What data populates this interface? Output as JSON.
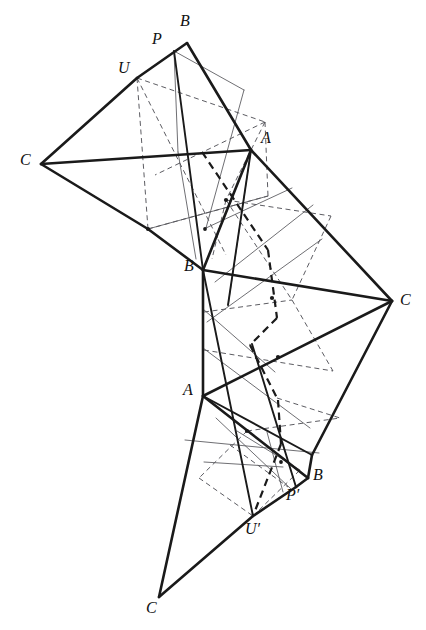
{
  "figure": {
    "kind": "geometric-construction-diagram",
    "background_color": "#ffffff",
    "stroke_colors": {
      "heavy_solid": "#1a1a1a",
      "light_solid": "#55555a",
      "light_dashed": "#4a4a50",
      "heavy_dashed": "#1a1a1a"
    },
    "stroke_widths": {
      "heavy_solid": 2.6,
      "medium_solid": 1.9,
      "light_solid": 0.85,
      "light_dashed": 0.9,
      "heavy_dashed": 2.2
    },
    "canvas": {
      "width": 426,
      "height": 630
    },
    "labels": [
      {
        "name": "label-B-top",
        "text": "B",
        "x": 180,
        "y": 13
      },
      {
        "name": "label-P-top",
        "text": "P",
        "x": 152,
        "y": 31
      },
      {
        "name": "label-U-top",
        "text": "U",
        "x": 118,
        "y": 60
      },
      {
        "name": "label-C-left",
        "text": "C",
        "x": 20,
        "y": 152
      },
      {
        "name": "label-A-upper",
        "text": "A",
        "x": 261,
        "y": 130
      },
      {
        "name": "label-B-middle",
        "text": "B",
        "x": 184,
        "y": 258
      },
      {
        "name": "label-C-right",
        "text": "C",
        "x": 400,
        "y": 292
      },
      {
        "name": "label-A-lower",
        "text": "A",
        "x": 183,
        "y": 382
      },
      {
        "name": "label-B-lower",
        "text": "B",
        "x": 313,
        "y": 467
      },
      {
        "name": "label-P-prime",
        "text": "P′",
        "x": 286,
        "y": 487
      },
      {
        "name": "label-U-prime",
        "text": "U′",
        "x": 245,
        "y": 521
      },
      {
        "name": "label-C-bottom",
        "text": "C",
        "x": 146,
        "y": 600
      }
    ],
    "points": {
      "B_top": {
        "x": 187,
        "y": 43
      },
      "P_top": {
        "x": 174,
        "y": 51
      },
      "U_top": {
        "x": 137,
        "y": 78
      },
      "C_left": {
        "x": 41,
        "y": 164
      },
      "A_upper": {
        "x": 251,
        "y": 150
      },
      "D_upper": {
        "x": 148,
        "y": 229
      },
      "B_middle": {
        "x": 203,
        "y": 270
      },
      "C_right": {
        "x": 392,
        "y": 301
      },
      "A_lower": {
        "x": 203,
        "y": 396
      },
      "B_lower": {
        "x": 308,
        "y": 478
      },
      "P_prime": {
        "x": 296,
        "y": 487
      },
      "U_prime": {
        "x": 253,
        "y": 516
      },
      "C_bottom": {
        "x": 159,
        "y": 597
      },
      "E_right": {
        "x": 312,
        "y": 455
      },
      "F_mid": {
        "x": 268,
        "y": 196
      },
      "G_mid": {
        "x": 252,
        "y": 344
      }
    },
    "heavy_solid_edges": [
      {
        "name": "edge-B-top-to-A-upper",
        "from": [
          187,
          43
        ],
        "to": [
          251,
          150
        ]
      },
      {
        "name": "edge-B-top-to-U-top",
        "from": [
          187,
          43
        ],
        "to": [
          137,
          78
        ]
      },
      {
        "name": "edge-U-top-to-C-left",
        "from": [
          137,
          78
        ],
        "to": [
          41,
          164
        ]
      },
      {
        "name": "edge-C-left-to-A-upper",
        "from": [
          41,
          164
        ],
        "to": [
          251,
          150
        ]
      },
      {
        "name": "edge-C-left-to-D-upper",
        "from": [
          41,
          164
        ],
        "to": [
          148,
          229
        ]
      },
      {
        "name": "edge-D-upper-to-B-middle",
        "from": [
          148,
          229
        ],
        "to": [
          203,
          270
        ]
      },
      {
        "name": "edge-A-upper-to-B-middle",
        "from": [
          251,
          150
        ],
        "to": [
          203,
          270
        ]
      },
      {
        "name": "edge-A-upper-to-C-right",
        "from": [
          251,
          150
        ],
        "to": [
          392,
          301
        ]
      },
      {
        "name": "edge-B-middle-to-C-right",
        "from": [
          203,
          270
        ],
        "to": [
          392,
          301
        ]
      },
      {
        "name": "edge-B-middle-to-A-lower",
        "from": [
          203,
          270
        ],
        "to": [
          203,
          396
        ]
      },
      {
        "name": "edge-A-lower-to-C-right",
        "from": [
          203,
          396
        ],
        "to": [
          392,
          301
        ]
      },
      {
        "name": "edge-C-right-to-E-right",
        "from": [
          392,
          301
        ],
        "to": [
          312,
          455
        ]
      },
      {
        "name": "edge-A-lower-to-B-lower",
        "from": [
          203,
          396
        ],
        "to": [
          308,
          478
        ]
      },
      {
        "name": "edge-E-right-to-B-lower",
        "from": [
          312,
          455
        ],
        "to": [
          308,
          478
        ]
      },
      {
        "name": "edge-B-lower-to-P-prime",
        "from": [
          308,
          478
        ],
        "to": [
          296,
          487
        ]
      },
      {
        "name": "edge-P-prime-to-U-prime",
        "from": [
          296,
          487
        ],
        "to": [
          253,
          516
        ]
      },
      {
        "name": "edge-U-prime-to-C-bottom",
        "from": [
          253,
          516
        ],
        "to": [
          159,
          597
        ]
      },
      {
        "name": "edge-A-lower-to-C-bottom",
        "from": [
          203,
          396
        ],
        "to": [
          159,
          597
        ]
      }
    ],
    "medium_solid_edges": [
      {
        "name": "edge-P-top-to-B-middle",
        "from": [
          174,
          51
        ],
        "to": [
          203,
          270
        ]
      },
      {
        "name": "edge-A-upper-to-G-ext",
        "from": [
          251,
          150
        ],
        "to": [
          228,
          305
        ]
      },
      {
        "name": "edge-B-middle-to-U-prime",
        "from": [
          203,
          270
        ],
        "to": [
          253,
          516
        ]
      },
      {
        "name": "edge-A-lower-to-E-right",
        "from": [
          203,
          396
        ],
        "to": [
          312,
          455
        ]
      },
      {
        "name": "edge-G-mid-to-P-prime",
        "from": [
          252,
          344
        ],
        "to": [
          296,
          487
        ]
      }
    ],
    "light_solid_edges": [
      {
        "name": "aux-P-top-to-F",
        "from": [
          174,
          51
        ],
        "to": [
          244,
          90
        ]
      },
      {
        "name": "aux-F-down",
        "from": [
          244,
          90
        ],
        "to": [
          206,
          228
        ]
      },
      {
        "name": "aux-P-top-to-mid",
        "from": [
          174,
          51
        ],
        "to": [
          178,
          152
        ]
      },
      {
        "name": "aux-mid-to-B-mid-low",
        "from": [
          178,
          152
        ],
        "to": [
          196,
          259
        ]
      },
      {
        "name": "aux-upper-cross-1",
        "from": [
          148,
          229
        ],
        "to": [
          268,
          196
        ]
      },
      {
        "name": "aux-upper-cross-2",
        "from": [
          206,
          228
        ],
        "to": [
          292,
          188
        ]
      },
      {
        "name": "aux-A-upper-to-low",
        "from": [
          251,
          150
        ],
        "to": [
          228,
          306
        ]
      },
      {
        "name": "aux-mid-right-1",
        "from": [
          215,
          282
        ],
        "to": [
          313,
          205
        ]
      },
      {
        "name": "aux-mid-right-2",
        "from": [
          207,
          322
        ],
        "to": [
          322,
          239
        ]
      },
      {
        "name": "aux-mid-left-1",
        "from": [
          203,
          309
        ],
        "to": [
          275,
          372
        ]
      },
      {
        "name": "aux-mid-left-2",
        "from": [
          203,
          348
        ],
        "to": [
          310,
          428
        ]
      },
      {
        "name": "aux-low-1",
        "from": [
          185,
          440
        ],
        "to": [
          319,
          453
        ]
      },
      {
        "name": "aux-low-2",
        "from": [
          216,
          418
        ],
        "to": [
          291,
          489
        ]
      },
      {
        "name": "aux-low-3",
        "from": [
          237,
          431
        ],
        "to": [
          300,
          470
        ]
      },
      {
        "name": "aux-low-4",
        "from": [
          204,
          462
        ],
        "to": [
          283,
          467
        ]
      },
      {
        "name": "aux-low-5",
        "from": [
          267,
          432
        ],
        "to": [
          283,
          492
        ]
      }
    ],
    "light_dashed_edges": [
      {
        "name": "dash-U-to-right",
        "from": [
          137,
          78
        ],
        "to": [
          265,
          122
        ]
      },
      {
        "name": "dash-U-down",
        "from": [
          137,
          78
        ],
        "to": [
          148,
          229
        ]
      },
      {
        "name": "dash-upper-para-bottom",
        "from": [
          148,
          229
        ],
        "to": [
          268,
          196
        ]
      },
      {
        "name": "dash-upper-para-right",
        "from": [
          265,
          122
        ],
        "to": [
          268,
          196
        ]
      },
      {
        "name": "dash-upper-diag-1",
        "from": [
          137,
          78
        ],
        "to": [
          226,
          255
        ]
      },
      {
        "name": "dash-upper-diag-2",
        "from": [
          265,
          122
        ],
        "to": [
          155,
          175
        ]
      },
      {
        "name": "dash-mid-1",
        "from": [
          226,
          200
        ],
        "to": [
          331,
          216
        ]
      },
      {
        "name": "dash-mid-2",
        "from": [
          226,
          200
        ],
        "to": [
          292,
          300
        ]
      },
      {
        "name": "dash-mid-3",
        "from": [
          331,
          216
        ],
        "to": [
          292,
          300
        ]
      },
      {
        "name": "dash-mid-4",
        "from": [
          226,
          200
        ],
        "to": [
          212,
          259
        ]
      },
      {
        "name": "dash-mid-5",
        "from": [
          265,
          122
        ],
        "to": [
          226,
          200
        ]
      },
      {
        "name": "dash-mid-lower-1",
        "from": [
          204,
          312
        ],
        "to": [
          292,
          300
        ]
      },
      {
        "name": "dash-mid-lower-2",
        "from": [
          204,
          350
        ],
        "to": [
          333,
          371
        ]
      },
      {
        "name": "dash-mid-lower-3",
        "from": [
          292,
          300
        ],
        "to": [
          333,
          371
        ]
      },
      {
        "name": "dash-low-1",
        "from": [
          247,
          431
        ],
        "to": [
          340,
          418
        ]
      },
      {
        "name": "dash-low-2",
        "from": [
          247,
          431
        ],
        "to": [
          199,
          478
        ]
      },
      {
        "name": "dash-low-3",
        "from": [
          199,
          478
        ],
        "to": [
          253,
          516
        ]
      },
      {
        "name": "dash-low-4",
        "from": [
          253,
          516
        ],
        "to": [
          300,
          470
        ]
      },
      {
        "name": "dash-low-5",
        "from": [
          277,
          398
        ],
        "to": [
          340,
          418
        ]
      },
      {
        "name": "dash-low-6",
        "from": [
          230,
          445
        ],
        "to": [
          288,
          487
        ]
      }
    ],
    "heavy_dashed_path": {
      "name": "heavy-dashed-construction-path",
      "vertices": [
        [
          232,
          198
        ],
        [
          202,
          152
        ],
        [
          268,
          250
        ],
        [
          275,
          310
        ],
        [
          252,
          344
        ],
        [
          277,
          398
        ],
        [
          280,
          440
        ],
        [
          253,
          516
        ]
      ]
    },
    "heavy_dashed_segments": [
      {
        "name": "heavy-dash-seg-1",
        "from": [
          202,
          152
        ],
        "to": [
          268,
          250
        ]
      },
      {
        "name": "heavy-dash-seg-2",
        "from": [
          268,
          250
        ],
        "to": [
          277,
          318
        ]
      },
      {
        "name": "heavy-dash-seg-3",
        "from": [
          277,
          318
        ],
        "to": [
          250,
          345
        ]
      },
      {
        "name": "heavy-dash-seg-4",
        "from": [
          250,
          345
        ],
        "to": [
          278,
          400
        ]
      },
      {
        "name": "heavy-dash-seg-5",
        "from": [
          278,
          400
        ],
        "to": [
          281,
          444
        ]
      },
      {
        "name": "heavy-dash-seg-6",
        "from": [
          281,
          444
        ],
        "to": [
          253,
          516
        ]
      }
    ],
    "node_dots": [
      {
        "name": "node-dot-upper-left",
        "x": 148,
        "y": 229,
        "r": 2.1
      },
      {
        "name": "node-dot-upper-mid",
        "x": 205,
        "y": 229,
        "r": 1.9
      },
      {
        "name": "node-dot-mid-upper",
        "x": 226,
        "y": 200,
        "r": 2.1
      },
      {
        "name": "node-dot-mid-center",
        "x": 272,
        "y": 298,
        "r": 2.1
      },
      {
        "name": "node-dot-mid-lower",
        "x": 278,
        "y": 357,
        "r": 2.1
      },
      {
        "name": "node-dot-low-upper",
        "x": 247,
        "y": 431,
        "r": 2.1
      },
      {
        "name": "node-dot-low-mid",
        "x": 281,
        "y": 462,
        "r": 1.9
      }
    ]
  }
}
